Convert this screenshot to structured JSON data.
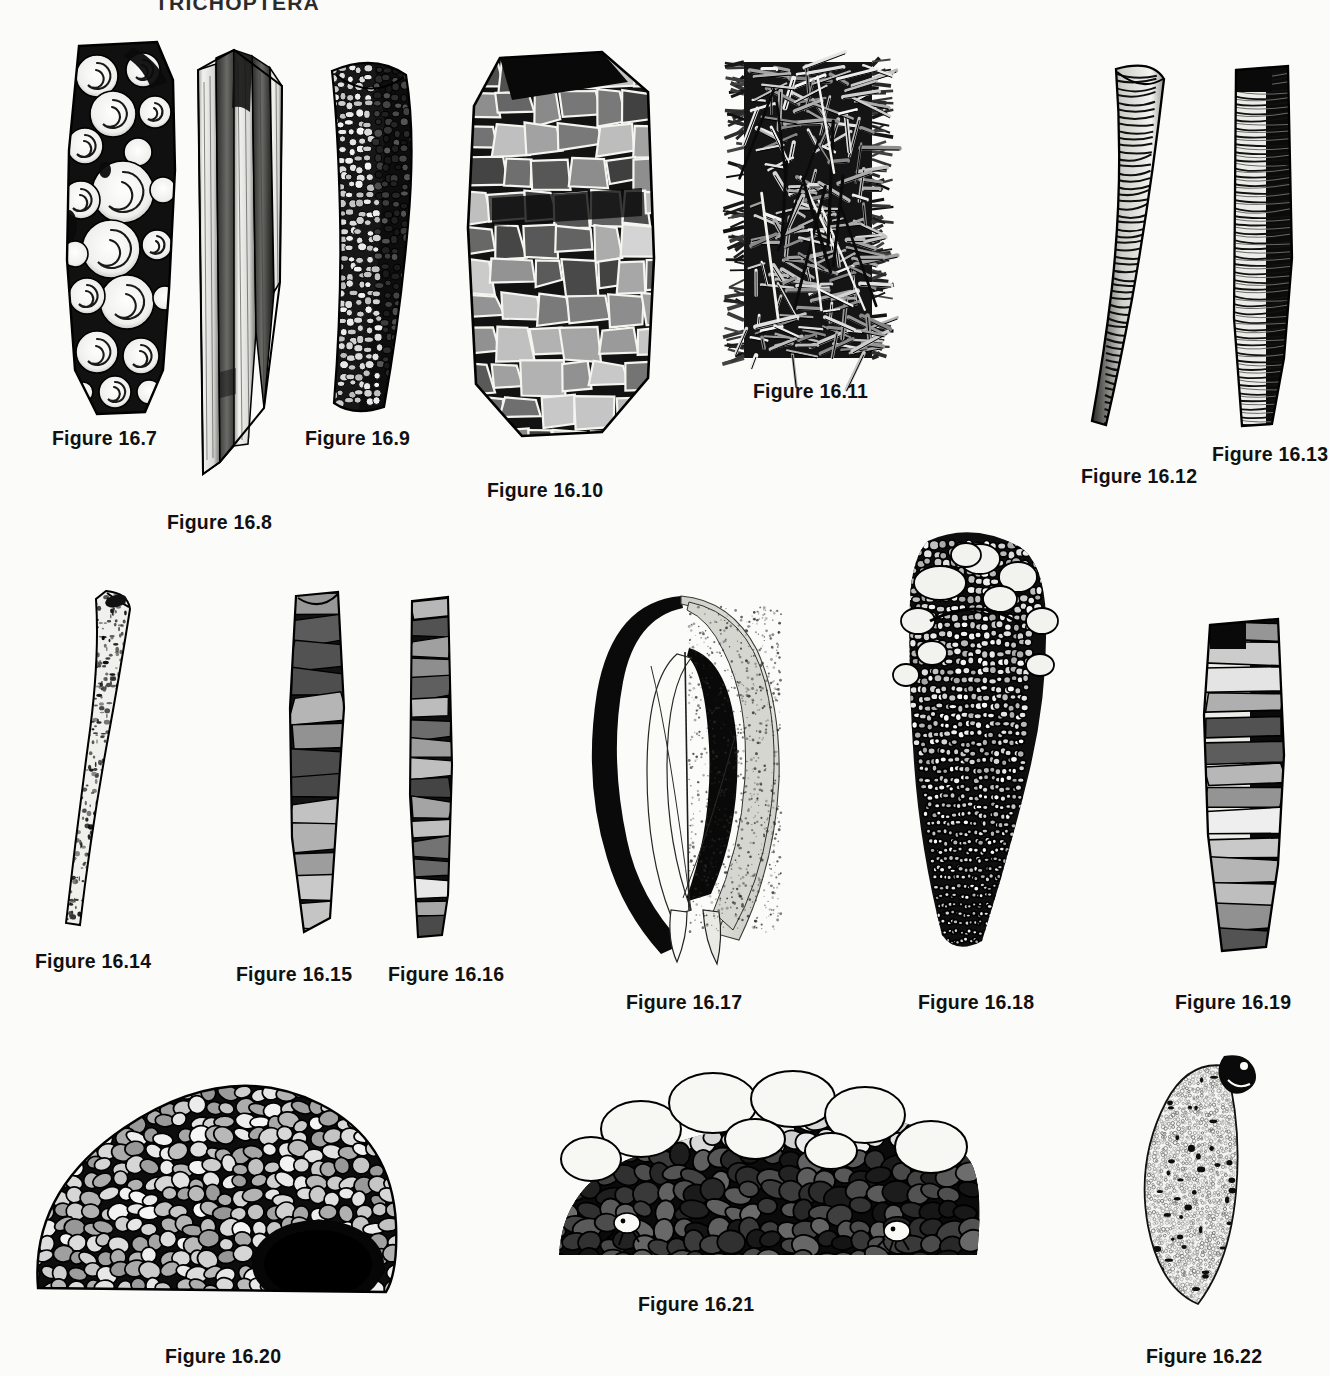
{
  "page": {
    "running_head": "TRICHOPTERA",
    "background_color": "#fbfbfa",
    "ink_color": "#000000",
    "width": 1330,
    "height": 1376
  },
  "figures": [
    {
      "id": "16.7",
      "caption": "Figure 16.7",
      "subject": "caddisfly larval case constructed of coiled snail shells",
      "case_material": "snail-shells",
      "orientation": "vertical",
      "caption_x": 52,
      "caption_y": 427,
      "art_x": 45,
      "art_y": 40,
      "art_w": 150,
      "art_h": 380
    },
    {
      "id": "16.8",
      "caption": "Figure 16.8",
      "subject": "caddisfly larval case of long parallel plant stem fragments",
      "case_material": "plant-stems",
      "orientation": "vertical",
      "caption_x": 167,
      "caption_y": 511,
      "art_x": 190,
      "art_y": 42,
      "art_w": 105,
      "art_h": 440
    },
    {
      "id": "16.9",
      "caption": "Figure 16.9",
      "subject": "slightly curved caddisfly case of fine mineral sand grains",
      "case_material": "sand-grains",
      "orientation": "vertical-curved",
      "caption_x": 305,
      "caption_y": 427,
      "art_x": 312,
      "art_y": 55,
      "art_w": 115,
      "art_h": 360
    },
    {
      "id": "16.10",
      "caption": "Figure 16.10",
      "subject": "broad caddisfly case of large flat mineral plates",
      "case_material": "flat-rock-plates",
      "orientation": "vertical-broad",
      "caption_x": 487,
      "caption_y": 479,
      "art_x": 452,
      "art_y": 48,
      "art_w": 215,
      "art_h": 400
    },
    {
      "id": "16.11",
      "caption": "Figure 16.11",
      "subject": "shaggy caddisfly case of crisscrossed twigs and conifer needles",
      "case_material": "twigs-needles",
      "orientation": "vertical",
      "caption_x": 753,
      "caption_y": 380,
      "art_x": 722,
      "art_y": 50,
      "art_w": 175,
      "art_h": 320
    },
    {
      "id": "16.12",
      "caption": "Figure 16.12",
      "subject": "smooth curved horn-shaped case of spirally wound silk and fine sand",
      "case_material": "silk-fine-sand",
      "orientation": "curved-horn",
      "caption_x": 1081,
      "caption_y": 465,
      "art_x": 1090,
      "art_y": 55,
      "art_w": 85,
      "art_h": 380
    },
    {
      "id": "16.13",
      "caption": "Figure 16.13",
      "subject": "straight ringed case built of stacked transverse bands",
      "case_material": "transverse-bands",
      "orientation": "vertical",
      "caption_x": 1212,
      "caption_y": 443,
      "art_x": 1222,
      "art_y": 58,
      "art_w": 85,
      "art_h": 370
    },
    {
      "id": "16.14",
      "caption": "Figure 16.14",
      "subject": "slender tapering curved tube of very fine sand",
      "case_material": "fine-sand",
      "orientation": "curved-slender",
      "caption_x": 35,
      "caption_y": 950,
      "art_x": 62,
      "art_y": 585,
      "art_w": 100,
      "art_h": 345
    },
    {
      "id": "16.15",
      "caption": "Figure 16.15",
      "subject": "case of irregular flat bark and leaf fragments",
      "case_material": "bark-fragments",
      "orientation": "vertical-curved",
      "caption_x": 236,
      "caption_y": 963,
      "art_x": 276,
      "art_y": 588,
      "art_w": 90,
      "art_h": 350
    },
    {
      "id": "16.16",
      "caption": "Figure 16.16",
      "subject": "narrow straight case of rectangular leaf pieces",
      "case_material": "leaf-pieces",
      "orientation": "vertical",
      "caption_x": 388,
      "caption_y": 963,
      "art_x": 398,
      "art_y": 595,
      "art_w": 70,
      "art_h": 345
    },
    {
      "id": "16.17",
      "caption": "Figure 16.17",
      "subject": "flattened purse-like case made from two large leaf pieces",
      "case_material": "whole-leaves",
      "orientation": "leaf-purse",
      "caption_x": 626,
      "caption_y": 991,
      "art_x": 585,
      "art_y": 592,
      "art_w": 210,
      "art_h": 375
    },
    {
      "id": "16.18",
      "caption": "Figure 16.18",
      "subject": "conical tapering case of graded pebbles with coarse stones at the mouth",
      "case_material": "graded-pebbles",
      "orientation": "conical",
      "caption_x": 918,
      "caption_y": 991,
      "art_x": 870,
      "art_y": 525,
      "art_w": 200,
      "art_h": 430
    },
    {
      "id": "16.19",
      "caption": "Figure 16.19",
      "subject": "straight case of large flat stone slabs",
      "case_material": "stone-slabs",
      "orientation": "vertical",
      "caption_x": 1175,
      "caption_y": 991,
      "art_x": 1192,
      "art_y": 615,
      "art_w": 110,
      "art_h": 340
    },
    {
      "id": "16.20",
      "caption": "Figure 16.20",
      "subject": "dome-shaped pebble retreat with open dark chamber",
      "case_material": "pebbles",
      "orientation": "dome",
      "caption_x": 165,
      "caption_y": 1345,
      "art_x": 22,
      "art_y": 1052,
      "art_w": 380,
      "art_h": 255
    },
    {
      "id": "16.21",
      "caption": "Figure 16.21",
      "subject": "low mound of large pale pebbles sheltering larvae",
      "case_material": "large-pebbles",
      "orientation": "mound",
      "caption_x": 638,
      "caption_y": 1293,
      "art_x": 545,
      "art_y": 1055,
      "art_w": 440,
      "art_h": 215
    },
    {
      "id": "16.22",
      "caption": "Figure 16.22",
      "subject": "flat tongue-shaped case of very fine sand with larva at the apex",
      "case_material": "very-fine-sand",
      "orientation": "tongue",
      "caption_x": 1146,
      "caption_y": 1345,
      "art_x": 1132,
      "art_y": 1050,
      "art_w": 130,
      "art_h": 260
    }
  ]
}
